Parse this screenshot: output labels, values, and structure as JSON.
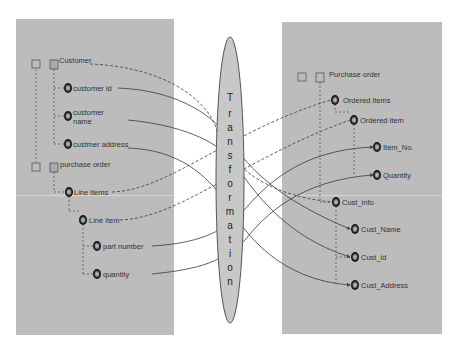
{
  "source_schema": {
    "nodes": [
      {
        "id": "customer",
        "label": "Customer",
        "type": "square",
        "x": 54,
        "y": 64,
        "lx": 59,
        "ly": 56
      },
      {
        "id": "customer_id",
        "label": "customer id",
        "type": "circle",
        "x": 68,
        "y": 88,
        "lx": 73,
        "ly": 84
      },
      {
        "id": "customer_name",
        "label": "customer\nname",
        "type": "circle",
        "x": 68,
        "y": 116,
        "lx": 73,
        "ly": 108
      },
      {
        "id": "customer_address",
        "label": "custmer address",
        "type": "circle",
        "x": 68,
        "y": 144,
        "lx": 73,
        "ly": 140
      },
      {
        "id": "purchase_order",
        "label": "purchase order",
        "type": "square",
        "x": 54,
        "y": 167,
        "lx": 60,
        "ly": 160
      },
      {
        "id": "line_items",
        "label": "Line items",
        "type": "circle",
        "x": 69,
        "y": 192,
        "lx": 74,
        "ly": 188
      },
      {
        "id": "line_item",
        "label": "Line item",
        "type": "circle",
        "x": 83,
        "y": 220,
        "lx": 89,
        "ly": 216
      },
      {
        "id": "part_number",
        "label": "part number",
        "type": "circle",
        "x": 97,
        "y": 246,
        "lx": 103,
        "ly": 242
      },
      {
        "id": "quantity",
        "label": "quantity",
        "type": "circle",
        "x": 97,
        "y": 274,
        "lx": 103,
        "ly": 270
      }
    ],
    "root_squares": [
      {
        "x": 36,
        "y": 64
      },
      {
        "x": 36,
        "y": 167
      }
    ]
  },
  "target_schema": {
    "nodes": [
      {
        "id": "purchase_order",
        "label": "Purchase order",
        "type": "square",
        "x": 320,
        "y": 77,
        "lx": 329,
        "ly": 70
      },
      {
        "id": "ordered_items",
        "label": "Ordered items",
        "type": "circle",
        "x": 335,
        "y": 100,
        "lx": 343,
        "ly": 96
      },
      {
        "id": "ordered_item",
        "label": "Ordered item",
        "type": "circle",
        "x": 354,
        "y": 120,
        "lx": 360,
        "ly": 116
      },
      {
        "id": "item_no",
        "label": "Item_No.",
        "type": "circle",
        "x": 377,
        "y": 147,
        "lx": 383,
        "ly": 143
      },
      {
        "id": "quantity",
        "label": "Quantity",
        "type": "circle",
        "x": 377,
        "y": 175,
        "lx": 383,
        "ly": 171
      },
      {
        "id": "cust_info",
        "label": "Cust_info",
        "type": "circle",
        "x": 336,
        "y": 202,
        "lx": 342,
        "ly": 198
      },
      {
        "id": "cust_name",
        "label": "Cust_Name",
        "type": "circle",
        "x": 355,
        "y": 229,
        "lx": 361,
        "ly": 225
      },
      {
        "id": "cust_id",
        "label": "Cust_id",
        "type": "circle",
        "x": 355,
        "y": 257,
        "lx": 361,
        "ly": 253
      },
      {
        "id": "cust_address",
        "label": "Cust_Address",
        "type": "circle",
        "x": 355,
        "y": 285,
        "lx": 361,
        "ly": 281
      }
    ],
    "root_squares": [
      {
        "x": 302,
        "y": 77
      }
    ]
  },
  "transformation": {
    "label": "Transformation",
    "letters": [
      "T",
      "r",
      "a",
      "n",
      "s",
      "f",
      "o",
      "r",
      "m",
      "a",
      "t",
      "i",
      "o",
      "n"
    ]
  },
  "colors": {
    "panel": "#bcbcbc",
    "ellipse_fill": "#c8c8c8",
    "line": "#444444",
    "node_ring": "#2a2a2a"
  }
}
